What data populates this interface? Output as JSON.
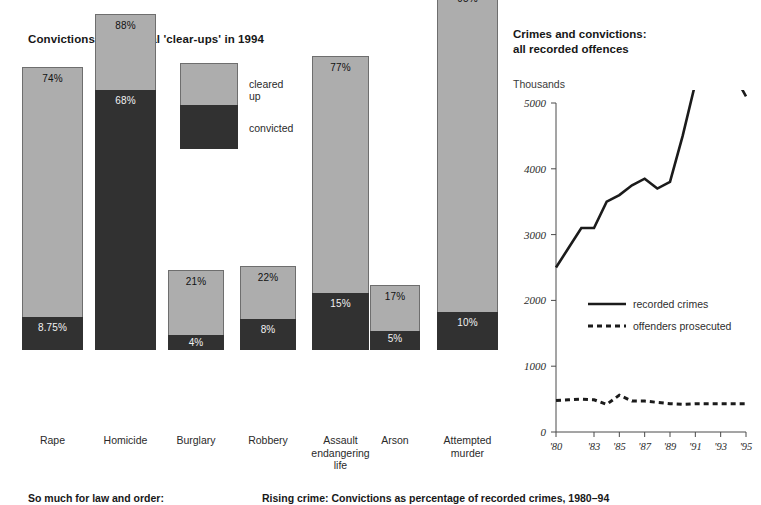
{
  "bar_panel": {
    "title": "Convictions and official 'clear-ups' in 1994",
    "legend": {
      "cleared_label": "cleared up",
      "convicted_label": "convicted"
    }
  },
  "line_panel": {
    "title": "Crimes and convictions:\nall recorded offences",
    "units": "Thousands",
    "legend": {
      "solid_label": "recorded crimes",
      "dashed_label": "offenders prosecuted"
    }
  },
  "footer": {
    "caption_left": "So much for law and order:",
    "caption_right": "Rising crime: Convictions as percentage of recorded crimes, 1980–94"
  },
  "chart_data": [
    {
      "type": "bar",
      "subtype": "stacked-vertical",
      "title": "Convictions and official 'clear-ups' in 1994",
      "xlabel": "",
      "ylabel": "",
      "ylim": [
        0,
        100
      ],
      "grid": false,
      "legend_position": "inside-top-left",
      "value_suffix": "%",
      "colors": {
        "cleared_up": "#adadad",
        "convicted": "#313131",
        "outline": "#6e6e6e"
      },
      "categories": [
        "Rape",
        "Homicide",
        "Burglary",
        "Robbery",
        "Assault\nendangering\nlife",
        "Arson",
        "Attempted\nmurder"
      ],
      "series": [
        {
          "name": "cleared up",
          "values": [
            74,
            88,
            21,
            22,
            77,
            17,
            95
          ],
          "labels": [
            "74%",
            "88%",
            "21%",
            "22%",
            "77%",
            "17%",
            "95%"
          ]
        },
        {
          "name": "convicted",
          "values": [
            8.75,
            68,
            4,
            8,
            15,
            5,
            10
          ],
          "labels": [
            "8.75%",
            "68%",
            "4%",
            "8%",
            "15%",
            "5%",
            "10%"
          ]
        }
      ]
    },
    {
      "type": "line",
      "title": "Crimes and convictions: all recorded offences",
      "xlabel": "",
      "ylabel": "Thousands",
      "ylim": [
        0,
        5000
      ],
      "yticks": [
        0,
        1000,
        2000,
        3000,
        4000,
        5000
      ],
      "ytick_labels": [
        "0",
        "1000",
        "2000",
        "3000",
        "4000",
        "5000"
      ],
      "xlim": [
        1980,
        1995
      ],
      "xticks": [
        1980,
        1983,
        1985,
        1987,
        1989,
        1991,
        1993,
        1995
      ],
      "xtick_labels": [
        "'80",
        "'83",
        "'85",
        "'87",
        "'89",
        "'91",
        "'93",
        "'95"
      ],
      "grid": false,
      "legend_position": "center-left",
      "x": [
        1980,
        1981,
        1982,
        1983,
        1984,
        1985,
        1986,
        1987,
        1988,
        1989,
        1990,
        1991,
        1992,
        1993,
        1994,
        1995
      ],
      "series": [
        {
          "name": "recorded crimes",
          "style": "solid",
          "values": [
            2500,
            2800,
            3100,
            3100,
            3500,
            3600,
            3750,
            3850,
            3700,
            3800,
            4500,
            5300,
            5550,
            5550,
            5450,
            5100
          ]
        },
        {
          "name": "offenders prosecuted",
          "style": "dashed",
          "values": [
            480,
            490,
            500,
            490,
            420,
            560,
            470,
            470,
            450,
            430,
            420,
            430,
            430,
            430,
            430,
            430
          ]
        }
      ]
    }
  ]
}
